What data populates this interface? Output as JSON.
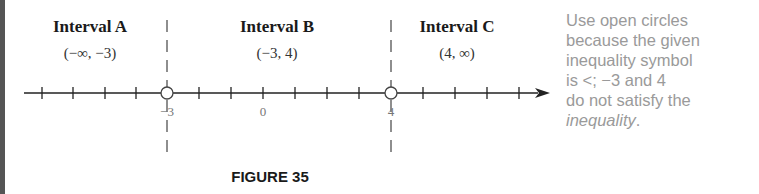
{
  "figure": {
    "caption": "FIGURE 35",
    "intervals": [
      {
        "title": "Interval A",
        "range": "(−∞, −3)"
      },
      {
        "title": "Interval B",
        "range": "(−3, 4)"
      },
      {
        "title": "Interval C",
        "range": "(4, ∞)"
      }
    ],
    "number_line": {
      "labels": [
        {
          "value": "−3"
        },
        {
          "value": "0"
        },
        {
          "value": "4"
        }
      ],
      "open_points": [
        -3,
        4
      ],
      "arrow": "right-arrow"
    }
  },
  "note": {
    "lines": [
      "Use open circles",
      "because the given",
      "inequality symbol",
      "is <; −3 and 4",
      "do not satisfy the"
    ],
    "last_line_italic": "inequality",
    "last_line_end": "."
  },
  "colors": {
    "text": "#1a1a1a",
    "note_text": "#9a9a9a",
    "tick_label": "#777777",
    "left_rule": "#555555"
  }
}
